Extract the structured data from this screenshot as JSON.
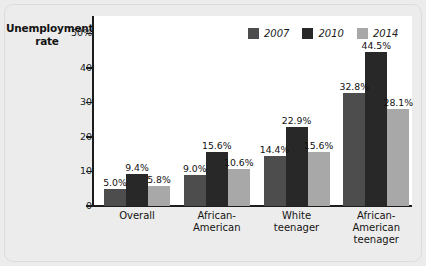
{
  "chart_data": {
    "type": "bar",
    "title": "Unemployment rate",
    "xlabel": "",
    "ylabel": "Unemployment rate",
    "ylim": [
      0,
      55
    ],
    "grid": false,
    "legend_position": "top-right",
    "categories": [
      "Overall",
      "African-American",
      "White teenager",
      "African-American teenager"
    ],
    "category_lines": [
      [
        "Overall"
      ],
      [
        "African-",
        "American"
      ],
      [
        "White",
        "teenager"
      ],
      [
        "African-",
        "American",
        "teenager"
      ]
    ],
    "ticks": [
      "50%",
      "40",
      "30",
      "20",
      "10",
      "0"
    ],
    "tick_values": [
      50,
      40,
      30,
      20,
      10,
      0
    ],
    "series": [
      {
        "name": "2007",
        "color": "#4d4d4d",
        "values": [
          5.0,
          9.0,
          14.4,
          32.8
        ],
        "labels": [
          "5.0%",
          "9.0%",
          "14.4%",
          "32.8%"
        ]
      },
      {
        "name": "2010",
        "color": "#282828",
        "values": [
          9.4,
          15.6,
          22.9,
          44.5
        ],
        "labels": [
          "9.4%",
          "15.6%",
          "22.9%",
          "44.5%"
        ]
      },
      {
        "name": "2014",
        "color": "#a8a8a8",
        "values": [
          5.8,
          10.6,
          15.6,
          28.1
        ],
        "labels": [
          "5.8%",
          "10.6%",
          "15.6%",
          "28.1%"
        ]
      }
    ]
  },
  "colors": {
    "panel": "#ececec",
    "plot": "#ffffff",
    "axis": "#1c1c1c",
    "text": "#141414"
  }
}
